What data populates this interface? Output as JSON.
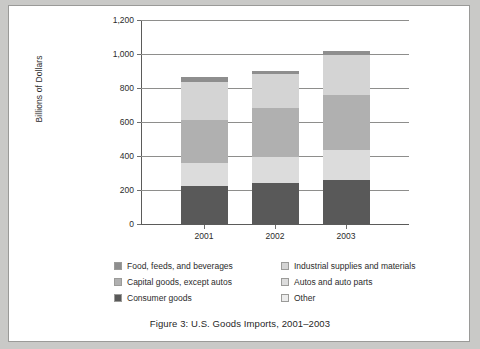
{
  "figure": {
    "caption": "Figure 3:  U.S. Goods Imports, 2001–2003"
  },
  "colors": {
    "food": "#8e8e8e",
    "industrial": "#d4d4d4",
    "capital": "#b0b0b0",
    "autos": "#dcdcdc",
    "consumer": "#595959",
    "other": "#ececec",
    "gridline": "#8e8e8c",
    "axis": "#5b5b5a",
    "text": "#2b2b2b",
    "paper": "#ffffff",
    "page_background": "#c9c9c7"
  },
  "chart_data": {
    "type": "bar",
    "stacked": true,
    "title": "Figure 3:  U.S. Goods Imports, 2001–2003",
    "xlabel": "",
    "ylabel": "Billions of Dollars",
    "categories": [
      "2001",
      "2002",
      "2003"
    ],
    "ylim": [
      0,
      1200
    ],
    "yticks": [
      0,
      200,
      400,
      600,
      800,
      1000,
      1200
    ],
    "ytick_labels": [
      "0",
      "200",
      "400",
      "600",
      "800",
      "1,000",
      "1,200"
    ],
    "grid": true,
    "legend_position": "bottom",
    "series": [
      {
        "name": "Consumer goods",
        "color": "#595959",
        "values": [
          225,
          240,
          260
        ]
      },
      {
        "name": "Autos and auto parts",
        "color": "#dcdcdc",
        "values": [
          135,
          155,
          175
        ]
      },
      {
        "name": "Capital goods, except autos",
        "color": "#b0b0b0",
        "values": [
          250,
          285,
          325
        ]
      },
      {
        "name": "Industrial supplies and materials",
        "color": "#d4d4d4",
        "values": [
          225,
          205,
          235
        ]
      },
      {
        "name": "Food, feeds, and beverages",
        "color": "#8e8e8e",
        "values": [
          30,
          15,
          25
        ]
      }
    ],
    "totals": [
      865,
      900,
      1020
    ]
  },
  "legend": {
    "left_column": [
      {
        "label": "Food, feeds, and beverages",
        "color": "#8e8e8e"
      },
      {
        "label": "Capital goods, except autos",
        "color": "#b0b0b0"
      },
      {
        "label": "Consumer goods",
        "color": "#595959"
      }
    ],
    "right_column": [
      {
        "label": "Industrial supplies and materials",
        "color": "#d4d4d4"
      },
      {
        "label": "Autos and auto parts",
        "color": "#dcdcdc"
      },
      {
        "label": "Other",
        "color": "#ececec"
      }
    ]
  }
}
